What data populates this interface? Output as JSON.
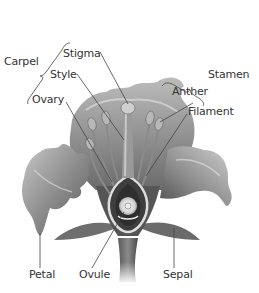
{
  "diagram": {
    "labels": {
      "carpel": "Carpel",
      "stigma": "Stigma",
      "style": "Style",
      "ovary": "Ovary",
      "stamen": "Stamen",
      "anther": "Anther",
      "filament": "Filament",
      "petal": "Petal",
      "ovule": "Ovule",
      "sepal": "Sepal"
    },
    "groups": [
      {
        "name": "Carpel",
        "parts": [
          "Stigma",
          "Style",
          "Ovary"
        ]
      },
      {
        "name": "Stamen",
        "parts": [
          "Anther",
          "Filament"
        ]
      }
    ],
    "colors": {
      "text": "#333333",
      "leader_line": "#444444",
      "petal_light": "#bdbdbd",
      "petal_dark": "#5e5e5e",
      "background": "#ffffff"
    }
  }
}
